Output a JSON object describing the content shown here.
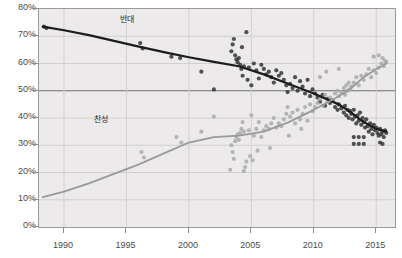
{
  "chart_data": {
    "type": "scatter",
    "title": "",
    "subtitle": "",
    "xlabel": "",
    "ylabel": "",
    "xlim": [
      1988,
      2016.5
    ],
    "ylim": [
      0,
      80
    ],
    "grid": true,
    "legend_position": "inline-annotation",
    "y_ticks": [
      0,
      10,
      20,
      30,
      40,
      50,
      60,
      70,
      80
    ],
    "y_tick_labels": [
      "0%",
      "10%",
      "20%",
      "30%",
      "40%",
      "50%",
      "60%",
      "70%",
      "80%"
    ],
    "x_ticks": [
      1990,
      1995,
      2000,
      2005,
      2010,
      2015
    ],
    "x_tick_labels": [
      "1990",
      "1995",
      "2000",
      "2005",
      "2010",
      "2015"
    ],
    "highlight_line_y": 50,
    "series": [
      {
        "name": "반대",
        "label": "반대",
        "color": "#1c1c1c",
        "point_color": "#2e2e2e",
        "trend": [
          [
            1988.3,
            73.5
          ],
          [
            1990,
            72.2
          ],
          [
            1992,
            70.4
          ],
          [
            1994,
            68.3
          ],
          [
            1996,
            66.2
          ],
          [
            1998,
            64.2
          ],
          [
            2000,
            62.3
          ],
          [
            2002,
            60.6
          ],
          [
            2004,
            59.0
          ],
          [
            2006,
            56.0
          ],
          [
            2008,
            52.5
          ],
          [
            2010,
            49.0
          ],
          [
            2012,
            45.0
          ],
          [
            2013,
            42.0
          ],
          [
            2014,
            38.5
          ],
          [
            2015,
            36.0
          ],
          [
            2015.8,
            35.0
          ]
        ],
        "points": [
          [
            1988.4,
            73.5
          ],
          [
            1988.6,
            73.0
          ],
          [
            1996.1,
            67.5
          ],
          [
            1996.3,
            65.5
          ],
          [
            1998.6,
            62.5
          ],
          [
            1999.3,
            62.0
          ],
          [
            2001.0,
            57.0
          ],
          [
            2002.0,
            50.5
          ],
          [
            2003.4,
            64.5
          ],
          [
            2003.5,
            67.0
          ],
          [
            2003.6,
            69.0
          ],
          [
            2003.7,
            63.0
          ],
          [
            2003.8,
            61.5
          ],
          [
            2003.9,
            60.5
          ],
          [
            2004.0,
            62.0
          ],
          [
            2004.1,
            59.5
          ],
          [
            2004.2,
            58.0
          ],
          [
            2004.25,
            66.0
          ],
          [
            2004.3,
            55.5
          ],
          [
            2004.4,
            59.0
          ],
          [
            2004.6,
            71.5
          ],
          [
            2004.7,
            54.0
          ],
          [
            2004.8,
            58.5
          ],
          [
            2005.0,
            52.0
          ],
          [
            2005.2,
            60.0
          ],
          [
            2005.4,
            57.5
          ],
          [
            2005.6,
            54.5
          ],
          [
            2005.8,
            59.5
          ],
          [
            2006.0,
            58.0
          ],
          [
            2006.2,
            56.0
          ],
          [
            2006.4,
            57.0
          ],
          [
            2006.6,
            55.0
          ],
          [
            2006.8,
            53.0
          ],
          [
            2007.0,
            57.5
          ],
          [
            2007.2,
            55.5
          ],
          [
            2007.4,
            56.5
          ],
          [
            2007.6,
            54.0
          ],
          [
            2007.8,
            52.0
          ],
          [
            2007.9,
            49.5
          ],
          [
            2008.1,
            52.5
          ],
          [
            2008.3,
            51.0
          ],
          [
            2008.5,
            55.0
          ],
          [
            2008.7,
            50.0
          ],
          [
            2008.9,
            53.5
          ],
          [
            2009.1,
            51.5
          ],
          [
            2009.3,
            49.0
          ],
          [
            2009.5,
            54.0
          ],
          [
            2009.7,
            48.0
          ],
          [
            2009.9,
            50.5
          ],
          [
            2010.1,
            49.0
          ],
          [
            2010.3,
            47.5
          ],
          [
            2010.5,
            46.0
          ],
          [
            2010.7,
            48.5
          ],
          [
            2010.9,
            44.5
          ],
          [
            2011.1,
            47.0
          ],
          [
            2011.3,
            45.5
          ],
          [
            2011.5,
            46.5
          ],
          [
            2011.7,
            44.0
          ],
          [
            2011.9,
            43.0
          ],
          [
            2012.0,
            45.0
          ],
          [
            2012.2,
            43.5
          ],
          [
            2012.4,
            42.0
          ],
          [
            2012.5,
            44.5
          ],
          [
            2012.6,
            41.0
          ],
          [
            2012.7,
            43.0
          ],
          [
            2012.8,
            40.0
          ],
          [
            2012.9,
            42.5
          ],
          [
            2013.0,
            41.5
          ],
          [
            2013.1,
            39.5
          ],
          [
            2013.2,
            43.0
          ],
          [
            2013.3,
            40.5
          ],
          [
            2013.4,
            38.0
          ],
          [
            2013.5,
            41.0
          ],
          [
            2013.6,
            39.0
          ],
          [
            2013.7,
            42.0
          ],
          [
            2013.8,
            37.5
          ],
          [
            2013.9,
            40.0
          ],
          [
            2014.0,
            38.5
          ],
          [
            2014.1,
            36.5
          ],
          [
            2014.2,
            39.5
          ],
          [
            2014.3,
            37.0
          ],
          [
            2014.4,
            35.0
          ],
          [
            2014.5,
            38.0
          ],
          [
            2014.6,
            36.0
          ],
          [
            2014.7,
            34.0
          ],
          [
            2014.8,
            37.5
          ],
          [
            2014.9,
            35.5
          ],
          [
            2015.0,
            36.5
          ],
          [
            2015.1,
            34.5
          ],
          [
            2015.2,
            33.5
          ],
          [
            2015.3,
            36.0
          ],
          [
            2015.4,
            34.0
          ],
          [
            2015.5,
            35.0
          ],
          [
            2015.6,
            33.0
          ],
          [
            2015.7,
            35.5
          ],
          [
            2015.8,
            34.5
          ],
          [
            2013.2,
            33.0
          ],
          [
            2013.6,
            33.0
          ],
          [
            2014.0,
            33.0
          ],
          [
            2013.2,
            30.5
          ],
          [
            2013.6,
            30.5
          ],
          [
            2014.0,
            30.5
          ],
          [
            2015.3,
            31.0
          ],
          [
            2015.5,
            30.5
          ]
        ]
      },
      {
        "name": "찬성",
        "label": "찬성",
        "color": "#9a9a9a",
        "point_color": "#a8a8a8",
        "trend": [
          [
            1988.3,
            11.0
          ],
          [
            1990,
            13.0
          ],
          [
            1992,
            16.0
          ],
          [
            1994,
            19.5
          ],
          [
            1996,
            23.0
          ],
          [
            1998,
            27.0
          ],
          [
            2000,
            31.0
          ],
          [
            2002,
            33.0
          ],
          [
            2004,
            33.5
          ],
          [
            2006,
            35.0
          ],
          [
            2008,
            38.5
          ],
          [
            2010,
            43.0
          ],
          [
            2012,
            48.0
          ],
          [
            2013,
            51.0
          ],
          [
            2014,
            55.0
          ],
          [
            2015,
            58.0
          ],
          [
            2015.8,
            60.0
          ]
        ],
        "points": [
          [
            1996.2,
            27.5
          ],
          [
            1996.4,
            25.5
          ],
          [
            1999.0,
            33.0
          ],
          [
            1999.4,
            31.0
          ],
          [
            2001.0,
            35.0
          ],
          [
            2002.0,
            40.5
          ],
          [
            2003.4,
            30.0
          ],
          [
            2003.5,
            27.5
          ],
          [
            2003.6,
            25.0
          ],
          [
            2003.7,
            31.5
          ],
          [
            2003.8,
            33.0
          ],
          [
            2003.9,
            34.0
          ],
          [
            2004.0,
            32.0
          ],
          [
            2004.1,
            34.5
          ],
          [
            2004.2,
            36.0
          ],
          [
            2004.3,
            38.5
          ],
          [
            2004.4,
            35.0
          ],
          [
            2004.5,
            22.0
          ],
          [
            2004.6,
            24.0
          ],
          [
            2004.8,
            35.5
          ],
          [
            2005.0,
            41.0
          ],
          [
            2005.2,
            33.5
          ],
          [
            2005.4,
            36.0
          ],
          [
            2005.6,
            38.5
          ],
          [
            2005.8,
            33.0
          ],
          [
            2006.0,
            35.5
          ],
          [
            2006.2,
            37.0
          ],
          [
            2006.4,
            36.0
          ],
          [
            2006.6,
            38.0
          ],
          [
            2006.8,
            40.0
          ],
          [
            2007.0,
            36.5
          ],
          [
            2007.2,
            38.0
          ],
          [
            2007.4,
            37.0
          ],
          [
            2007.6,
            39.5
          ],
          [
            2007.8,
            41.5
          ],
          [
            2007.9,
            44.0
          ],
          [
            2008.1,
            40.5
          ],
          [
            2008.3,
            42.0
          ],
          [
            2008.5,
            38.0
          ],
          [
            2008.7,
            43.0
          ],
          [
            2008.9,
            39.5
          ],
          [
            2009.1,
            41.5
          ],
          [
            2009.3,
            44.0
          ],
          [
            2009.5,
            39.0
          ],
          [
            2009.7,
            45.0
          ],
          [
            2009.9,
            42.5
          ],
          [
            2010.1,
            44.0
          ],
          [
            2010.3,
            45.5
          ],
          [
            2010.5,
            47.0
          ],
          [
            2010.7,
            44.5
          ],
          [
            2010.9,
            48.5
          ],
          [
            2011.1,
            46.0
          ],
          [
            2011.3,
            47.5
          ],
          [
            2011.5,
            46.5
          ],
          [
            2011.7,
            49.0
          ],
          [
            2011.9,
            50.0
          ],
          [
            2012.0,
            48.0
          ],
          [
            2012.2,
            49.5
          ],
          [
            2012.4,
            51.0
          ],
          [
            2012.5,
            48.5
          ],
          [
            2012.6,
            52.0
          ],
          [
            2012.7,
            50.0
          ],
          [
            2012.8,
            53.0
          ],
          [
            2012.9,
            50.5
          ],
          [
            2013.0,
            51.5
          ],
          [
            2013.2,
            53.0
          ],
          [
            2013.4,
            55.0
          ],
          [
            2013.6,
            52.0
          ],
          [
            2013.8,
            55.5
          ],
          [
            2014.0,
            54.0
          ],
          [
            2014.2,
            56.0
          ],
          [
            2014.4,
            58.0
          ],
          [
            2014.6,
            55.0
          ],
          [
            2014.8,
            57.5
          ],
          [
            2015.0,
            56.5
          ],
          [
            2015.2,
            58.5
          ],
          [
            2015.4,
            60.0
          ],
          [
            2015.5,
            62.0
          ],
          [
            2015.6,
            59.0
          ],
          [
            2015.7,
            61.0
          ],
          [
            2015.8,
            60.5
          ],
          [
            2010.5,
            55.0
          ],
          [
            2011.0,
            57.0
          ],
          [
            2012.0,
            58.0
          ],
          [
            2014.8,
            62.5
          ],
          [
            2015.2,
            63.0
          ],
          [
            2009.0,
            36.0
          ],
          [
            2008.0,
            33.5
          ],
          [
            2006.5,
            29.0
          ],
          [
            2005.5,
            28.0
          ],
          [
            2004.9,
            26.0
          ],
          [
            2005.1,
            24.5
          ],
          [
            2003.3,
            21.0
          ],
          [
            2004.4,
            20.5
          ]
        ]
      }
    ]
  },
  "annotations": {
    "oppose_label": "반대",
    "support_label": "찬성"
  },
  "colors": {
    "plot_background": "#eceaea",
    "grid": "#d2d0d0",
    "axis": "#8d8d8d",
    "highlight": "#6d6d6d",
    "oppose": "#1c1c1c",
    "support": "#9a9a9a",
    "tick_text": "#4a4a4a"
  }
}
